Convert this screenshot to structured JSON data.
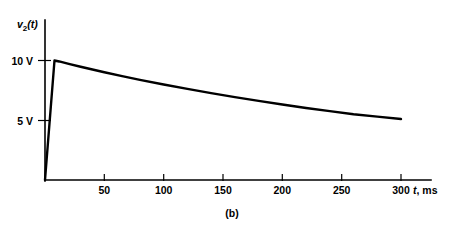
{
  "figure": {
    "caption": "(b)",
    "y_axis_title_main": "v",
    "y_axis_title_sub": "2",
    "y_axis_title_tail": "(t)",
    "x_axis_title_italic": "t",
    "x_axis_title_rest": ", ms"
  },
  "chart_data": {
    "type": "line",
    "title": "",
    "subtitle": "",
    "xlabel": "t, ms",
    "ylabel": "v2(t)",
    "xlim": [
      0,
      325
    ],
    "ylim": [
      0,
      11.5
    ],
    "grid": false,
    "legend": null,
    "x_ticks": [
      50,
      100,
      150,
      200,
      250,
      300
    ],
    "x_tick_labels": [
      "50",
      "100",
      "150",
      "200",
      "250",
      "300"
    ],
    "y_ticks": [
      5,
      10
    ],
    "y_tick_labels": [
      "5 V",
      "10 V"
    ],
    "annotations": [
      "(b)"
    ],
    "series": [
      {
        "name": "v2(t)",
        "x": [
          0,
          8,
          12,
          20,
          30,
          40,
          50,
          65,
          80,
          100,
          120,
          140,
          160,
          180,
          200,
          220,
          240,
          260,
          280,
          300
        ],
        "y": [
          0.0,
          10.0,
          9.92,
          9.72,
          9.48,
          9.25,
          9.02,
          8.69,
          8.38,
          7.99,
          7.62,
          7.27,
          6.94,
          6.62,
          6.32,
          6.03,
          5.76,
          5.5,
          5.3,
          5.1
        ]
      }
    ],
    "peak": {
      "x": 8,
      "y": 10.0
    },
    "end_point": {
      "x": 300,
      "y": 5.1
    }
  }
}
